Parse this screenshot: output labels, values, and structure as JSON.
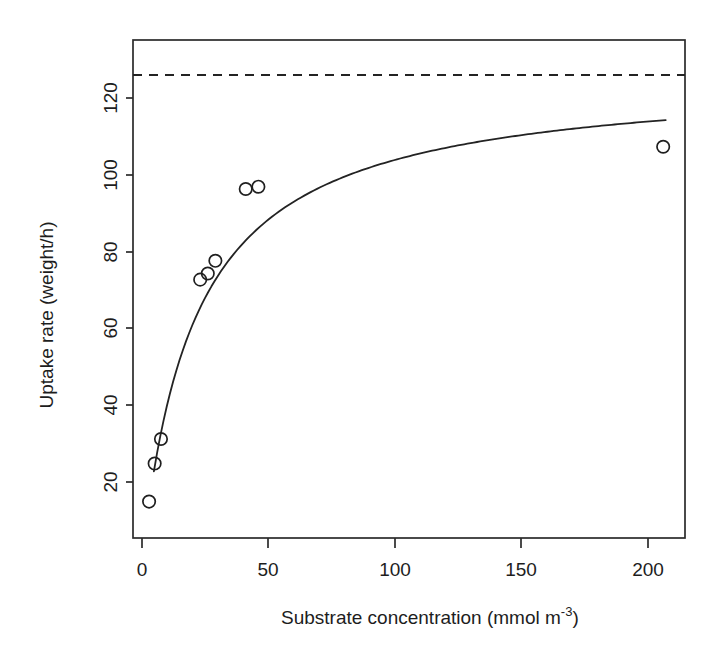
{
  "chart_data": {
    "type": "scatter",
    "title": "",
    "xlabel": "Substrate concentration (mmol m",
    "xlabel_sup": "-3",
    "xlabel_tail": ")",
    "xlabel_full": "Substrate concentration (mmol m^-3)",
    "ylabel": "Uptake rate (weight/h)",
    "xlim": [
      -2,
      218
    ],
    "ylim": [
      9,
      130
    ],
    "xticks": [
      0,
      50,
      100,
      150,
      200
    ],
    "xticklabels": [
      "0",
      "50",
      "100",
      "150",
      "200"
    ],
    "yticks": [
      20,
      40,
      60,
      80,
      100,
      120
    ],
    "yticklabels": [
      "20",
      "40",
      "60",
      "80",
      "100",
      "120"
    ],
    "grid": false,
    "legend": "none",
    "box": true,
    "x": [
      2.8,
      5.0,
      7.5,
      23.0,
      26.0,
      29.0,
      41.0,
      46.0,
      206.0
    ],
    "y": [
      14.9,
      24.8,
      31.2,
      72.7,
      74.3,
      77.6,
      96.3,
      96.9,
      107.3
    ],
    "series": [
      {
        "name": "observations",
        "type": "scatter",
        "marker": "open-circle",
        "color": "#1f1f1f",
        "points": [
          {
            "x": 2.8,
            "y": 14.9
          },
          {
            "x": 5.0,
            "y": 24.8
          },
          {
            "x": 7.5,
            "y": 31.2
          },
          {
            "x": 23.0,
            "y": 72.7
          },
          {
            "x": 26.0,
            "y": 74.3
          },
          {
            "x": 29.0,
            "y": 77.6
          },
          {
            "x": 41.0,
            "y": 96.3
          },
          {
            "x": 46.0,
            "y": 96.9
          },
          {
            "x": 206.0,
            "y": 107.3
          }
        ]
      },
      {
        "name": "michaelis-menten-fit",
        "type": "line",
        "style": "solid",
        "color": "#232323",
        "model": "Vmax*x/(K+x)",
        "Vmax": 126.0,
        "K": 21.3,
        "x_start": 4.7,
        "x_end": 207.0
      },
      {
        "name": "asymptote-Vmax",
        "type": "line",
        "style": "dashed",
        "color": "#232323",
        "value": 126.0
      }
    ]
  }
}
